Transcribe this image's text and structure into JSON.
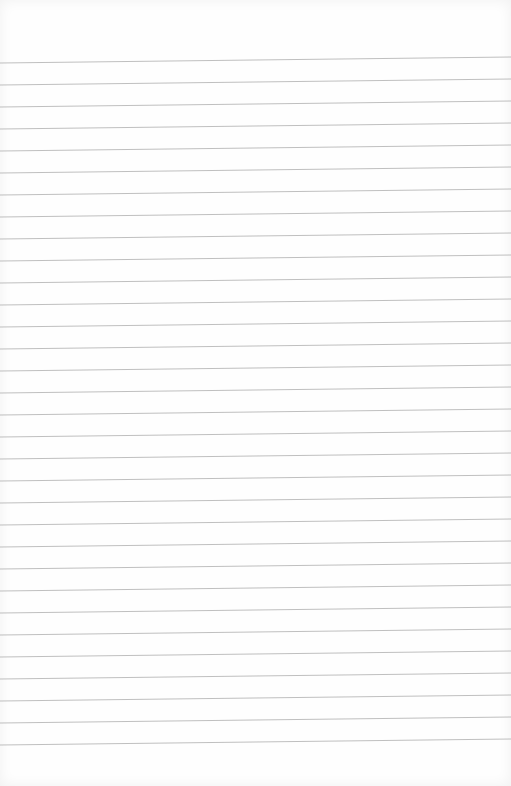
{
  "paper": {
    "background": "#fefefe",
    "line_color": "#b8b8b8",
    "line_count": 32,
    "first_line_y_left": 63,
    "first_line_y_right": 57,
    "line_spacing": 22.0
  }
}
